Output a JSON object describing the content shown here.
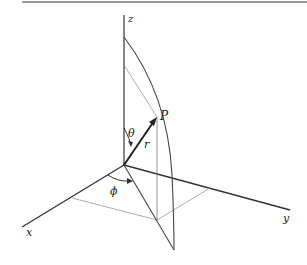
{
  "figure": {
    "type": "spherical-coordinates",
    "axes": {
      "x_label": "x",
      "y_label": "y",
      "z_label": "z"
    },
    "point_label": "P",
    "radius_label": "r",
    "polar_angle_label": "θ",
    "azimuth_angle_label": "ϕ"
  },
  "colors": {
    "ink": "#333333",
    "thin": "#777777",
    "background": "#ffffff"
  }
}
